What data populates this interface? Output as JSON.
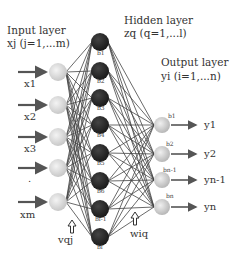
{
  "diagram": {
    "type": "neural-network",
    "layers": {
      "input": {
        "title": "Input layer",
        "subtitle": "xj (j=1,...m)",
        "nodes": [
          "x1",
          "x2",
          "x3",
          ".",
          "xm"
        ]
      },
      "hidden": {
        "title": "Hidden layer",
        "subtitle": "zq (q=1,...l)",
        "nodes": [
          "b1",
          "b2",
          "b3",
          "b4",
          "b5",
          "b6",
          "bl-1",
          "bl"
        ]
      },
      "output": {
        "title": "Output layer",
        "subtitle": "yi (i=1,...n)",
        "biases": [
          "b1",
          "b2",
          "bn-1",
          "bn"
        ],
        "outputs": [
          "y1",
          "y2",
          "yn-1",
          "yn"
        ]
      }
    },
    "weights": {
      "input_hidden": "vqj",
      "hidden_output": "wiq"
    },
    "colors": {
      "input_node": "#d8d8d8",
      "hidden_node": "#2a2a2a",
      "output_node": "#d0d0d0",
      "edge": "#444444",
      "arrow": "#555555"
    }
  }
}
